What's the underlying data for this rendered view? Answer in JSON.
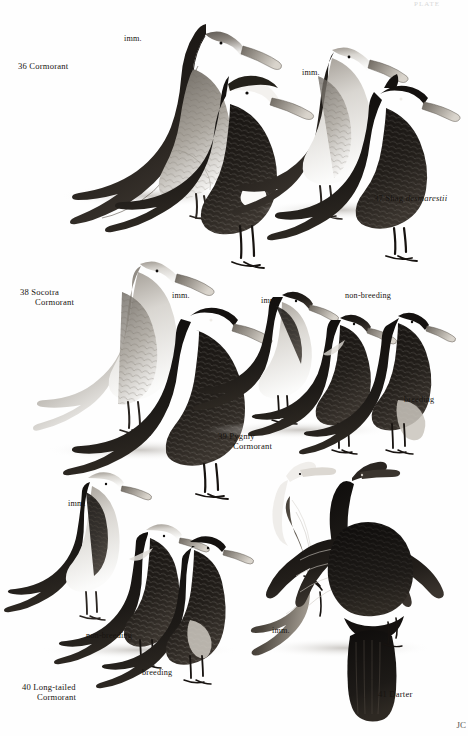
{
  "plate": {
    "page_corner_mark": "PLATE",
    "artist_signature": "JC",
    "background_color": "#ffffff",
    "ink_color": "#171310"
  },
  "species": [
    {
      "number": "36",
      "name": "Cormorant",
      "name_line2": "",
      "scientific": "",
      "label_x": 18,
      "label_y": 62,
      "annotations": [
        {
          "text": "imm.",
          "x": 124,
          "y": 34,
          "kind": "age"
        }
      ]
    },
    {
      "number": "37",
      "name": "Shag",
      "name_line2": "",
      "scientific": "desmarestii",
      "label_x": 374,
      "label_y": 194,
      "annotations": [
        {
          "text": "imm.",
          "x": 302,
          "y": 68,
          "kind": "age"
        }
      ]
    },
    {
      "number": "38",
      "name": "Socotra",
      "name_line2": "Cormorant",
      "scientific": "",
      "label_x": 20,
      "label_y": 288,
      "annotations": [
        {
          "text": "imm.",
          "x": 172,
          "y": 291,
          "kind": "age"
        }
      ]
    },
    {
      "number": "39",
      "name": "Pygmy",
      "name_line2": "Cormorant",
      "scientific": "",
      "label_x": 218,
      "label_y": 432,
      "annotations": [
        {
          "text": "imm.",
          "x": 261,
          "y": 296,
          "kind": "age"
        },
        {
          "text": "non-breeding",
          "x": 345,
          "y": 291,
          "kind": "plumage"
        },
        {
          "text": "breeding",
          "x": 404,
          "y": 395,
          "kind": "plumage"
        }
      ]
    },
    {
      "number": "40",
      "name": "Long-tailed",
      "name_line2": "Cormorant",
      "scientific": "",
      "label_x": 22,
      "label_y": 683,
      "annotations": [
        {
          "text": "imm.",
          "x": 68,
          "y": 499,
          "kind": "age"
        },
        {
          "text": "non-breeding",
          "x": 86,
          "y": 631,
          "kind": "plumage"
        },
        {
          "text": "breeding",
          "x": 142,
          "y": 668,
          "kind": "plumage"
        }
      ]
    },
    {
      "number": "41",
      "name": "Darter",
      "name_line2": "",
      "scientific": "",
      "label_x": 378,
      "label_y": 690,
      "annotations": [
        {
          "text": "imm.",
          "x": 272,
          "y": 626,
          "kind": "age"
        }
      ]
    }
  ]
}
